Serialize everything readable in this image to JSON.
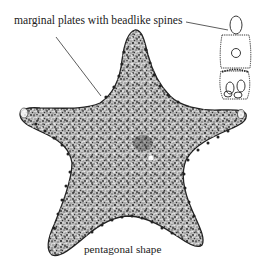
{
  "figure": {
    "labels": {
      "marginal_plates": "marginal plates with beadlike spines",
      "shape": "pentagonal shape"
    },
    "colors": {
      "ink": "#222222",
      "background": "#ffffff",
      "stipple_dark": "#2a2a2a",
      "stipple_mid": "#777777"
    }
  }
}
